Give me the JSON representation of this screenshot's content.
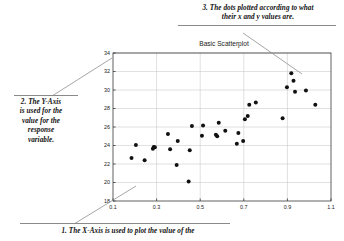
{
  "chart_data": {
    "type": "scatter",
    "title": "Basic Scatterplot",
    "xlabel": "",
    "ylabel": "",
    "xlim": [
      0.1,
      1.1
    ],
    "ylim": [
      18,
      34
    ],
    "xticks": [
      "0.1",
      "0.3",
      "0.5",
      "0.7",
      "0.9",
      "1.1"
    ],
    "xtick_values": [
      0.1,
      0.3,
      0.5,
      0.7,
      0.9,
      1.1
    ],
    "yticks": [
      "18",
      "20",
      "22",
      "24",
      "26",
      "28",
      "30",
      "32",
      "34"
    ],
    "ytick_values": [
      18,
      20,
      22,
      24,
      26,
      28,
      30,
      32,
      34
    ],
    "grid": true,
    "legend": null,
    "marker": {
      "shape": "circle",
      "color": "#111111",
      "size": 3.1
    },
    "points": [
      {
        "x": 0.185,
        "y": 22.65
      },
      {
        "x": 0.205,
        "y": 24.05
      },
      {
        "x": 0.245,
        "y": 22.4
      },
      {
        "x": 0.283,
        "y": 23.65
      },
      {
        "x": 0.287,
        "y": 23.85
      },
      {
        "x": 0.292,
        "y": 23.8
      },
      {
        "x": 0.352,
        "y": 25.25
      },
      {
        "x": 0.362,
        "y": 23.6
      },
      {
        "x": 0.392,
        "y": 21.9
      },
      {
        "x": 0.397,
        "y": 24.5
      },
      {
        "x": 0.447,
        "y": 20.1
      },
      {
        "x": 0.452,
        "y": 23.5
      },
      {
        "x": 0.462,
        "y": 26.1
      },
      {
        "x": 0.508,
        "y": 25.05
      },
      {
        "x": 0.513,
        "y": 26.15
      },
      {
        "x": 0.572,
        "y": 25.15
      },
      {
        "x": 0.578,
        "y": 25.0
      },
      {
        "x": 0.585,
        "y": 26.45
      },
      {
        "x": 0.615,
        "y": 25.6
      },
      {
        "x": 0.668,
        "y": 24.2
      },
      {
        "x": 0.675,
        "y": 25.35
      },
      {
        "x": 0.697,
        "y": 24.5
      },
      {
        "x": 0.705,
        "y": 26.85
      },
      {
        "x": 0.718,
        "y": 27.2
      },
      {
        "x": 0.725,
        "y": 28.4
      },
      {
        "x": 0.755,
        "y": 28.65
      },
      {
        "x": 0.878,
        "y": 26.95
      },
      {
        "x": 0.898,
        "y": 30.3
      },
      {
        "x": 0.918,
        "y": 31.8
      },
      {
        "x": 0.928,
        "y": 31.0
      },
      {
        "x": 0.935,
        "y": 29.8
      },
      {
        "x": 0.985,
        "y": 29.95
      },
      {
        "x": 1.028,
        "y": 28.4
      }
    ]
  },
  "annotations": {
    "three": {
      "line1": "3.  The dots plotted according to what",
      "line2": "their x and y values are."
    },
    "two": {
      "line1": "2.  The Y-Axis",
      "line2": "is used for the",
      "line3": "value for the",
      "line4": "response",
      "line5": "variable."
    },
    "one": {
      "line1": "1.  The X-Axis is used to plot the value of the"
    }
  },
  "colors": {
    "marker": "#111111",
    "grid": "#c8c8c8",
    "axis": "#3b3b3b",
    "leader": "#8f8f8f",
    "rule": "#8a8a8a",
    "text": "#111111",
    "background": "#ffffff"
  }
}
